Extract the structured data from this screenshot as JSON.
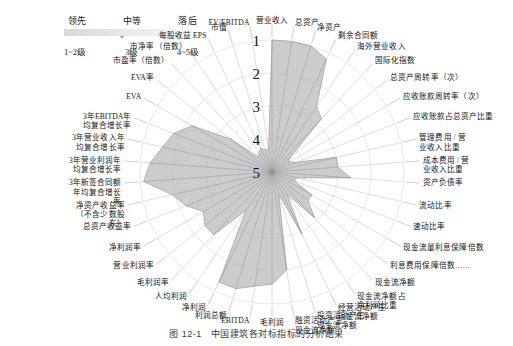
{
  "legend": {
    "tiers": [
      {
        "label": "领先",
        "grade": "1~2级"
      },
      {
        "label": "中等",
        "grade": "3级"
      },
      {
        "label": "落后",
        "grade": "4~5级"
      }
    ],
    "bar_colors": [
      "#d8d8d8",
      "#e2e2e2",
      "#ebebeb",
      "#f2f2f2"
    ]
  },
  "caption": {
    "number": "图 12-1",
    "text": "中国建筑各对标指标的分析结果"
  },
  "chart_data": {
    "type": "radar",
    "title": "中国建筑各对标指标的分析结果",
    "xlabel": "",
    "ylabel": "",
    "rings": [
      "1",
      "2",
      "3",
      "4",
      "5"
    ],
    "ring_note": "等级刻度：1 为最外环（领先），5 为圆心（落后）",
    "scale_inverted": true,
    "rlim": [
      1,
      5
    ],
    "grid": true,
    "legend_position": "top-left",
    "fill_color": "#b9b9b9",
    "line_color": "#8f8f8f",
    "categories": [
      "营业收入",
      "总资产",
      "净资产",
      "剩余合同额",
      "海外营业收入",
      "国际化指数",
      "总资产周转率（次）",
      "应收账款周转率（次）",
      "应收账款占总资产比重",
      "管理费用 / 营业收入比重",
      "成本费用 / 营业收入比重",
      "资产负债率",
      "流动比率",
      "速动比率",
      "现金流量利息保障倍数",
      "利息费用保障倍数……",
      "现金流净额",
      "现金流净额占净利润比重",
      "经营活动产生现金流净额",
      "投资活动产生现金流净额",
      "融资活动产生现金流净额",
      "毛利润",
      "EBITDA",
      "利润总额",
      "净利润",
      "人均利润",
      "毛利润率",
      "营业利润率",
      "净利润率",
      "总资产收益率",
      "净资产收益率（不含少数股东）",
      "3年新签合同额年均复合增长率",
      "3年营业利润年均复合增长率",
      "3年营业收入年均复合增长率",
      "3年EBITDA年均复合增长率",
      "EVA",
      "EVA率",
      "市盈率（倍数）",
      "市净率（倍数）",
      "每股收益 EPS",
      "市值",
      "EV/EBITDA"
    ],
    "values": [
      1.0,
      1.0,
      1.0,
      1.2,
      2.6,
      2.8,
      4.3,
      4.4,
      4.2,
      3.0,
      3.0,
      2.6,
      4.2,
      4.3,
      3.6,
      3.6,
      3.1,
      4.2,
      2.9,
      4.3,
      2.0,
      1.6,
      1.5,
      1.3,
      1.3,
      3.6,
      2.4,
      2.4,
      2.6,
      2.2,
      1.9,
      1.1,
      1.3,
      1.6,
      1.8,
      2.2,
      3.4,
      4.4,
      4.3,
      4.2,
      4.3,
      4.3
    ],
    "series": [
      {
        "name": "中国建筑",
        "values": [
          1.0,
          1.0,
          1.0,
          1.2,
          2.6,
          2.8,
          4.3,
          4.4,
          4.2,
          3.0,
          3.0,
          2.6,
          4.2,
          4.3,
          3.6,
          3.6,
          3.1,
          4.2,
          2.9,
          4.3,
          2.0,
          1.6,
          1.5,
          1.3,
          1.3,
          3.6,
          2.4,
          2.4,
          2.6,
          2.2,
          1.9,
          1.1,
          1.3,
          1.6,
          1.8,
          2.2,
          3.4,
          4.4,
          4.3,
          4.2,
          4.3,
          4.3
        ]
      }
    ]
  }
}
